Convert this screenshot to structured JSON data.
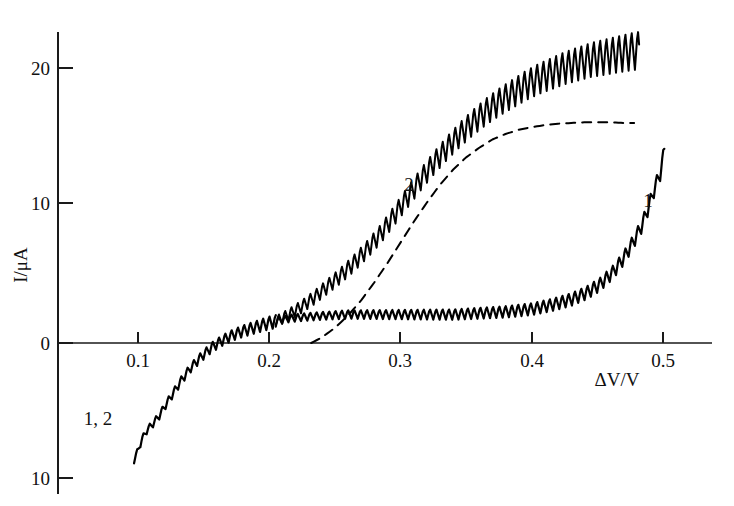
{
  "chart_data": {
    "type": "line",
    "title": "",
    "subtitle": "",
    "xlabel": "ΔV/V",
    "ylabel": "I/μA",
    "xlim": [
      0.055,
      0.525
    ],
    "ylim": [
      -11.5,
      23.5
    ],
    "grid": false,
    "legend_position": "inline-annotations",
    "xticks": [
      0.1,
      0.2,
      0.3,
      0.4,
      0.5
    ],
    "xtick_labels": [
      "0.1",
      "0.2",
      "0.3",
      "0.4",
      "0.5"
    ],
    "yticks": [
      20,
      10,
      0,
      -10
    ],
    "ytick_labels": [
      "20",
      "10",
      "0",
      "10"
    ],
    "annotations": [
      {
        "text": "1, 2",
        "x": 0.093,
        "y": -5.3,
        "note": "shared branch at negative current"
      },
      {
        "text": "2",
        "x": 0.303,
        "y": 11.6,
        "note": "upper oscillating curve"
      },
      {
        "text": "1",
        "x": 0.487,
        "y": 10.3,
        "note": "lower plateau curve"
      }
    ],
    "series": [
      {
        "name": "1, 2 shared branch",
        "label": "1, 2",
        "style": "solid",
        "color": "#000000",
        "oscillating": true,
        "oscillation_amplitude": 0.45,
        "x": [
          0.097,
          0.1,
          0.103,
          0.107,
          0.111,
          0.116,
          0.121,
          0.127,
          0.133,
          0.14,
          0.148,
          0.156,
          0.164,
          0.172,
          0.18,
          0.19,
          0.2,
          0.205
        ],
        "y": [
          -8.5,
          -7.8,
          -7.0,
          -6.3,
          -5.9,
          -5.3,
          -4.5,
          -3.6,
          -2.7,
          -1.8,
          -1.0,
          -0.3,
          0.2,
          0.6,
          0.9,
          1.2,
          1.5,
          1.6
        ]
      },
      {
        "name": "curve 1",
        "label": "1",
        "style": "solid",
        "color": "#000000",
        "oscillating": true,
        "oscillation_amplitude": 0.5,
        "x": [
          0.205,
          0.215,
          0.225,
          0.24,
          0.26,
          0.28,
          0.3,
          0.32,
          0.34,
          0.36,
          0.38,
          0.4,
          0.415,
          0.43,
          0.442,
          0.452,
          0.462,
          0.47,
          0.478,
          0.484,
          0.49,
          0.494,
          0.498,
          0.501
        ],
        "y": [
          1.6,
          1.8,
          1.9,
          2.0,
          2.1,
          2.1,
          2.1,
          2.1,
          2.1,
          2.2,
          2.3,
          2.5,
          2.8,
          3.2,
          3.7,
          4.3,
          5.2,
          6.2,
          7.5,
          8.6,
          10.2,
          11.4,
          12.4,
          14.0
        ]
      },
      {
        "name": "curve 2",
        "label": "2",
        "style": "solid",
        "color": "#000000",
        "oscillating": true,
        "oscillation_amplitude": 1.2,
        "x": [
          0.205,
          0.215,
          0.225,
          0.235,
          0.245,
          0.255,
          0.265,
          0.275,
          0.285,
          0.295,
          0.305,
          0.315,
          0.325,
          0.335,
          0.345,
          0.355,
          0.365,
          0.375,
          0.385,
          0.395,
          0.405,
          0.415,
          0.425,
          0.435,
          0.445,
          0.455,
          0.465,
          0.475,
          0.482
        ],
        "y": [
          1.6,
          2.1,
          2.7,
          3.4,
          4.2,
          5.0,
          5.9,
          6.9,
          8.0,
          9.3,
          10.6,
          11.9,
          13.1,
          14.2,
          15.2,
          16.1,
          16.9,
          17.6,
          18.2,
          18.8,
          19.3,
          19.7,
          20.1,
          20.4,
          20.7,
          20.9,
          21.1,
          21.3,
          21.4
        ]
      },
      {
        "name": "dashed reference",
        "label": "",
        "style": "dashed",
        "color": "#000000",
        "oscillating": false,
        "x": [
          0.232,
          0.24,
          0.25,
          0.26,
          0.27,
          0.28,
          0.29,
          0.3,
          0.31,
          0.32,
          0.33,
          0.34,
          0.35,
          0.36,
          0.37,
          0.38,
          0.39,
          0.4,
          0.41,
          0.42,
          0.43,
          0.44,
          0.45,
          0.46,
          0.47,
          0.478
        ],
        "y": [
          0.0,
          0.4,
          1.1,
          2.0,
          3.1,
          4.4,
          5.8,
          7.3,
          8.8,
          10.2,
          11.5,
          12.6,
          13.5,
          14.2,
          14.8,
          15.2,
          15.5,
          15.7,
          15.85,
          15.95,
          16.0,
          16.05,
          16.05,
          16.05,
          16.0,
          16.0
        ]
      }
    ]
  },
  "axes": {
    "x_axis_name": "delta-V-axis",
    "y_axis_name": "current-axis",
    "xlabel_display": "ΔV/V",
    "ylabel_display": "I/μA"
  },
  "tick_text": {
    "y20": "20",
    "y10": "10",
    "y0": "0",
    "ym10": "10",
    "x01": "0.1",
    "x02": "0.2",
    "x03": "0.3",
    "x04": "0.4",
    "x05": "0.5"
  },
  "labels": {
    "shared": "1, 2",
    "curve2": "2",
    "curve1": "1"
  },
  "colors": {
    "ink": "#000000",
    "background": "#ffffff"
  }
}
